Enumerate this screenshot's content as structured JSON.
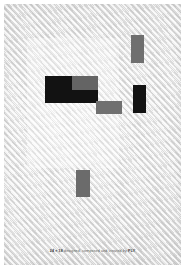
{
  "artwork": {
    "title": "Geometric composition",
    "background_color": "#ececec",
    "paper_color": "#ffffff",
    "texture": "diagonal-stripe-weave",
    "ghost_panel": {
      "name": "faint-light-panel",
      "x": 27,
      "y": 38,
      "w": 92,
      "h": 130,
      "color": "rgba(255,255,255,0.30)"
    },
    "blocks": [
      {
        "name": "grey-block-top-right",
        "tone": "grey",
        "color": "#6f6f6f",
        "x": 131,
        "y": 35,
        "w": 13,
        "h": 28
      },
      {
        "name": "black-block-large-left",
        "tone": "black",
        "color": "#121212",
        "x": 45,
        "y": 76,
        "w": 27,
        "h": 27
      },
      {
        "name": "grey-block-upper-middle",
        "tone": "grey",
        "color": "#646464",
        "x": 72,
        "y": 76,
        "w": 26,
        "h": 14
      },
      {
        "name": "black-block-lower-middle",
        "tone": "black",
        "color": "#121212",
        "x": 72,
        "y": 90,
        "w": 26,
        "h": 13
      },
      {
        "name": "grey-block-step-right",
        "tone": "grey",
        "color": "#707070",
        "x": 96,
        "y": 101,
        "w": 26,
        "h": 13
      },
      {
        "name": "black-block-right",
        "tone": "black",
        "color": "#121212",
        "x": 133,
        "y": 85,
        "w": 13,
        "h": 28
      },
      {
        "name": "grey-block-bottom-centre",
        "tone": "grey",
        "color": "#6b6b6b",
        "x": 76,
        "y": 170,
        "w": 14,
        "h": 27
      }
    ]
  },
  "caption": {
    "dimensions": "24 × 18",
    "body": "designed, composed and created by",
    "signature": "PLY"
  }
}
